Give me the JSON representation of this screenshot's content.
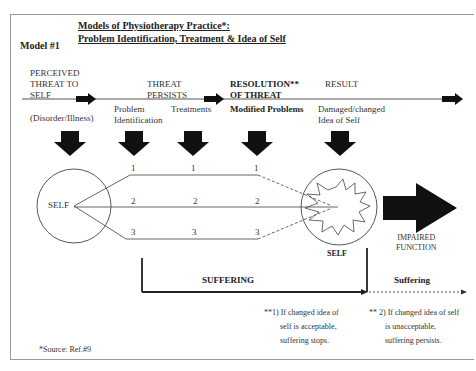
{
  "title": {
    "line1": "Models of Physiotherapy Practice*:",
    "line2": "Problem Identification, Treatment & Idea of Self"
  },
  "model_label": "Model #1",
  "timeline": {
    "stages": [
      {
        "id": "perceived-threat",
        "heading": [
          "PERCEIVED",
          "THREAT TO",
          "SELF"
        ],
        "sub": "(Disorder/Illness)"
      },
      {
        "id": "threat-persists",
        "heading": [
          "THREAT",
          "PERSISTS"
        ],
        "subs": [
          [
            "Problem",
            "Identification"
          ],
          [
            "Treatments"
          ]
        ]
      },
      {
        "id": "resolution",
        "heading": [
          "RESOLUTION**",
          "OF THREAT"
        ],
        "sub": "Modified Problems"
      },
      {
        "id": "result",
        "heading": [
          "RESULT"
        ],
        "sub": [
          "Damaged/changed",
          "Idea of  Self"
        ]
      }
    ]
  },
  "problem_lines": {
    "labels": [
      "1",
      "2",
      "3"
    ]
  },
  "self_left": "SELF",
  "self_right": "SELF",
  "impaired_function": [
    "IMPAIRED",
    "FUNCTION"
  ],
  "suffering_main": "SUFFERING",
  "suffering_after": "Suffering",
  "notes": {
    "note1": [
      "**1) If changed idea of",
      "self  is acceptable,",
      "suffering stops."
    ],
    "note2": [
      "** 2) If changed idea of self",
      "is unacceptable,",
      "suffering persists."
    ]
  },
  "source": "*Source: Ref.#9",
  "colors": {
    "ink": "#111111",
    "line": "#555555",
    "frame": "#9a9a9a"
  }
}
